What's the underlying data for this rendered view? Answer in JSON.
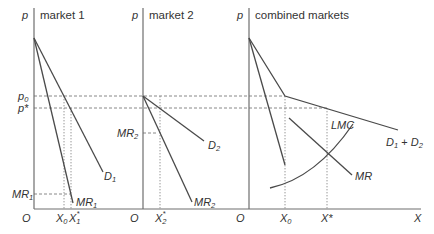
{
  "panels": [
    {
      "title": "market 1",
      "axis_y": "p",
      "origin": "O",
      "curves": [
        "D1",
        "MR1"
      ],
      "labels": {
        "p0": "p",
        "p0_sub": "0",
        "pstar": "p*",
        "mr_level": "MR",
        "mr_level_sub": "1",
        "d_curve": "D",
        "d_curve_sub": "1",
        "mr_curve": "MR",
        "mr_curve_sub": "1",
        "x0": "X",
        "x0_sub": "0",
        "xstar": "X",
        "xstar_sub": "1",
        "xstar_sup": "*"
      }
    },
    {
      "title": "market 2",
      "axis_y": "p",
      "origin": "O",
      "curves": [
        "D2",
        "MR2"
      ],
      "labels": {
        "mr_level": "MR",
        "mr_level_sub": "2",
        "d_curve": "D",
        "d_curve_sub": "2",
        "mr_curve": "MR",
        "mr_curve_sub": "2",
        "xstar": "X",
        "xstar_sub": "2",
        "xstar_sup": "*"
      }
    },
    {
      "title": "combined markets",
      "axis_y": "p",
      "axis_x": "X",
      "origin": "O",
      "curves": [
        "D1 + D2",
        "MR",
        "LMC"
      ],
      "labels": {
        "d_curve": "D",
        "d_curve_sub1": "1",
        "plus": " + ",
        "d_curve2": "D",
        "d_curve_sub2": "2",
        "mr_curve": "MR",
        "lmc_curve": "LMC",
        "x0": "X",
        "x0_sub": "0",
        "xstar": "X*"
      }
    }
  ]
}
